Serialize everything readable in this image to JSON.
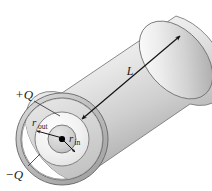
{
  "figure": {
    "background_color": "#ffffff",
    "labels": {
      "charge_positive": "+Q",
      "charge_negative": "−Q",
      "length": "L",
      "radius_outer_base": "r",
      "radius_outer_sub": "out",
      "radius_inner_base": "r",
      "radius_inner_sub": "in"
    },
    "colors": {
      "ink": "#1a1a1a",
      "line": "#111111",
      "leader": "#2b2b2b",
      "shell_stroke": "#6e6e6e",
      "shell_fill_light": "#e9e9e9",
      "shell_fill_mid": "#c9c9c9",
      "shell_fill_dark": "#a8a8a8",
      "body_light": "#fbfbfb",
      "body_dark": "#9a9a9a",
      "core_light": "#efefef",
      "core_dark": "#b4b4b4",
      "center_dot": "#000000"
    },
    "geometry": {
      "outer_ring_center_x": 62,
      "outer_ring_center_y": 139,
      "outer_ring_radius": 46,
      "outer_ring_thickness": 5,
      "mid_circle_radius": 27,
      "inner_core_radius": 14,
      "cylinder_axis_angle_deg": -41,
      "cylinder_far_center_x": 176,
      "cylinder_far_center_y": 60
    },
    "elements": [
      "outer-conductor-ring",
      "dielectric-cylinder-body",
      "inner-conductor-core",
      "center-axis-dot",
      "length-dimension-arrow",
      "radius-outer-arrow",
      "radius-inner-arrow",
      "positive-charge-leader",
      "negative-charge-leader"
    ]
  }
}
